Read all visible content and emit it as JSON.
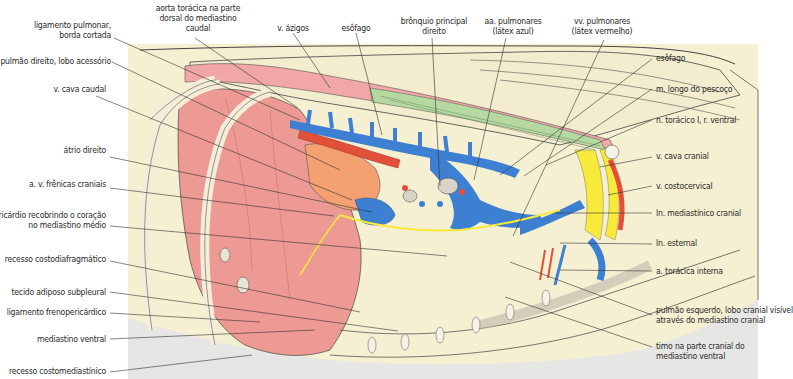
{
  "figure": {
    "colors": {
      "background_panel": "#f6f0d3",
      "panel_gray": "#e3e3e3",
      "lung": "#ee9a94",
      "lung_dark": "#e88680",
      "atrium": "#f4a070",
      "artery_red": "#e2503a",
      "vein_blue": "#3d7fd0",
      "nerve_yellow": "#f7ea3a",
      "muscle_pink": "#f0a7a5",
      "muscle_green": "#b6d9a2",
      "rib": "#f4eed8",
      "line": "#333333"
    }
  },
  "labels": {
    "left": [
      {
        "id": "ligamento-pulmonar",
        "line1": "ligamento pulmonar,",
        "line2": "borda cortada"
      },
      {
        "id": "pulmao-direito-lobo-acessorio",
        "line1": "pulmão direito, lobo acessório"
      },
      {
        "id": "v-cava-caudal",
        "line1": "v. cava caudal"
      },
      {
        "id": "atrio-direito",
        "line1": "átrio direito"
      },
      {
        "id": "a-v-frenicas-craniais",
        "line1": "a. v. frênicas craniais"
      },
      {
        "id": "pericardio",
        "line1": "pericárdio recobrindo o coração",
        "line2": "no mediastino médio"
      },
      {
        "id": "recesso-costodiafragmatico",
        "line1": "recesso costodiafragmático"
      },
      {
        "id": "tecido-adiposo-subpleural",
        "line1": "tecido adiposo subpleural"
      },
      {
        "id": "ligamento-frenopericardico",
        "line1": "ligamento frenopericárdico"
      },
      {
        "id": "mediastino-ventral",
        "line1": "mediastino ventral"
      },
      {
        "id": "recesso-costomediastinico",
        "line1": "recesso costomediastínico"
      }
    ],
    "top": [
      {
        "id": "aorta-toracica",
        "line1": "aorta torácica na parte",
        "line2": "dorsal do mediastino",
        "line3": "caudal"
      },
      {
        "id": "v-azigos",
        "line1": "v. ázigos"
      },
      {
        "id": "esofago-top",
        "line1": "esôfago"
      },
      {
        "id": "bronquio-principal-direito",
        "line1": "brônquio principal",
        "line2": "direito"
      },
      {
        "id": "aa-pulmonares",
        "line1": "aa. pulmonares",
        "line2": "(látex azul)"
      },
      {
        "id": "vv-pulmonares",
        "line1": "vv. pulmonares",
        "line2": "(látex vermelho)"
      }
    ],
    "right": [
      {
        "id": "esofago-right",
        "line1": "esôfago"
      },
      {
        "id": "m-longo-do-pescoco",
        "line1": "m. longo do pescoço"
      },
      {
        "id": "n-toracico",
        "line1": "n. torácico I, r. ventral"
      },
      {
        "id": "v-cava-cranial",
        "line1": "v. cava cranial"
      },
      {
        "id": "v-costocervical",
        "line1": "v. costocervical"
      },
      {
        "id": "ln-mediastinico-cranial",
        "line1": "ln. mediastínico cranial"
      },
      {
        "id": "ln-esternal",
        "line1": "ln. esternal"
      },
      {
        "id": "a-toracica-interna",
        "line1": "a. torácica interna"
      },
      {
        "id": "pulmao-esquerdo",
        "line1": "pulmão esquerdo, lobo cranial visível",
        "line2": "através do mediastino cranial"
      },
      {
        "id": "timo",
        "line1": "timo na parte cranial do",
        "line2": "mediastino ventral"
      }
    ]
  }
}
